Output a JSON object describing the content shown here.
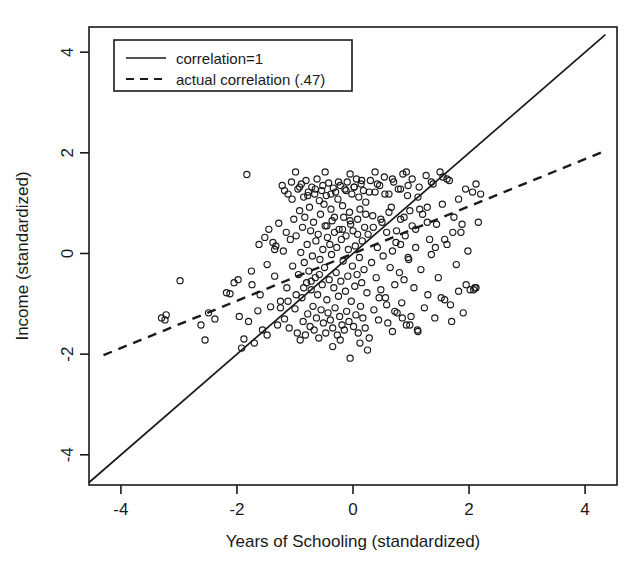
{
  "chart_data": {
    "type": "scatter",
    "title": "",
    "xlabel": "Years of Schooling (standardized)",
    "ylabel": "Income (standardized)",
    "xlim": [
      -4.55,
      4.55
    ],
    "ylim": [
      -4.6,
      4.5
    ],
    "xticks": [
      -4,
      -2,
      0,
      2,
      4
    ],
    "xtick_labels": [
      "-4",
      "-2",
      "0",
      "2",
      "4"
    ],
    "yticks": [
      -4,
      -2,
      0,
      2,
      4
    ],
    "ytick_labels": [
      "-4",
      "-2",
      "0",
      "2",
      "4"
    ],
    "grid": false,
    "legend_position": "top-left",
    "legend": [
      {
        "label": "correlation=1",
        "style": "solid"
      },
      {
        "label": "actual correlation (.47)",
        "style": "dashed"
      }
    ],
    "lines": [
      {
        "name": "correlation=1",
        "style": "solid",
        "slope": 1,
        "intercept": 0,
        "x0": -4.55,
        "y0": -4.55,
        "x1": 4.35,
        "y1": 4.35
      },
      {
        "name": "actual correlation (.47)",
        "style": "dashed",
        "slope": 0.47,
        "intercept": 0,
        "x0": -4.3,
        "y0": -2.02,
        "x1": 4.35,
        "y1": 2.04
      }
    ],
    "marker": {
      "shape": "circle-open",
      "radius_px": 3.1,
      "color": "#1a1a1a"
    },
    "n_points": 300,
    "points": [
      [
        -3.3,
        -1.28
      ],
      [
        -3.24,
        -1.32
      ],
      [
        -3.22,
        -1.22
      ],
      [
        -2.98,
        -0.54
      ],
      [
        -2.62,
        -1.42
      ],
      [
        -2.55,
        -1.72
      ],
      [
        -2.49,
        -1.18
      ],
      [
        -2.38,
        -1.3
      ],
      [
        -2.18,
        -0.78
      ],
      [
        -2.12,
        -0.8
      ],
      [
        -2.05,
        -0.58
      ],
      [
        -1.98,
        -0.52
      ],
      [
        -1.96,
        -1.25
      ],
      [
        -1.92,
        -1.88
      ],
      [
        -1.88,
        -1.7
      ],
      [
        -1.83,
        1.57
      ],
      [
        -1.8,
        -1.35
      ],
      [
        -1.74,
        -0.62
      ],
      [
        -1.7,
        -1.78
      ],
      [
        -1.64,
        -1.14
      ],
      [
        -1.6,
        -0.82
      ],
      [
        -1.56,
        -1.52
      ],
      [
        -1.52,
        0.32
      ],
      [
        -1.48,
        -1.62
      ],
      [
        -1.45,
        0.48
      ],
      [
        -1.42,
        -1.06
      ],
      [
        -1.38,
        0.22
      ],
      [
        -1.35,
        -0.45
      ],
      [
        -1.33,
        0.15
      ],
      [
        -1.3,
        -1.42
      ],
      [
        -1.28,
        0.6
      ],
      [
        -1.25,
        -0.95
      ],
      [
        -1.22,
        1.35
      ],
      [
        -1.2,
        0.05
      ],
      [
        -1.18,
        -1.3
      ],
      [
        -1.15,
        0.42
      ],
      [
        -1.14,
        -0.68
      ],
      [
        -1.12,
        1.18
      ],
      [
        -1.1,
        -1.48
      ],
      [
        -1.08,
        0.28
      ],
      [
        -1.06,
        1.42
      ],
      [
        -1.04,
        -0.25
      ],
      [
        -1.02,
        0.68
      ],
      [
        -1.0,
        -1.1
      ],
      [
        -0.99,
        1.62
      ],
      [
        -0.98,
        0.35
      ],
      [
        -0.96,
        -1.58
      ],
      [
        -0.95,
        1.28
      ],
      [
        -0.94,
        -0.42
      ],
      [
        -0.92,
        0.85
      ],
      [
        -0.91,
        -1.72
      ],
      [
        -0.9,
        0.02
      ],
      [
        -0.89,
        1.38
      ],
      [
        -0.88,
        -0.88
      ],
      [
        -0.87,
        0.52
      ],
      [
        -0.86,
        -1.35
      ],
      [
        -0.85,
        1.12
      ],
      [
        -0.84,
        -0.18
      ],
      [
        -0.83,
        0.72
      ],
      [
        -0.82,
        -1.62
      ],
      [
        -0.81,
        1.45
      ],
      [
        -0.8,
        -0.58
      ],
      [
        -0.79,
        0.18
      ],
      [
        -0.78,
        -1.2
      ],
      [
        -0.77,
        1.22
      ],
      [
        -0.76,
        -0.35
      ],
      [
        -0.75,
        0.92
      ],
      [
        -0.74,
        -1.45
      ],
      [
        -0.73,
        0.45
      ],
      [
        -0.72,
        -0.72
      ],
      [
        -0.71,
        1.32
      ],
      [
        -0.7,
        -0.05
      ],
      [
        -0.69,
        -1.05
      ],
      [
        -0.68,
        0.62
      ],
      [
        -0.67,
        -1.52
      ],
      [
        -0.66,
        1.18
      ],
      [
        -0.65,
        -0.48
      ],
      [
        -0.64,
        0.25
      ],
      [
        -0.63,
        -1.28
      ],
      [
        -0.62,
        1.48
      ],
      [
        -0.61,
        -0.82
      ],
      [
        -0.6,
        0.38
      ],
      [
        -0.59,
        -1.68
      ],
      [
        -0.58,
        1.05
      ],
      [
        -0.57,
        -0.12
      ],
      [
        -0.56,
        0.78
      ],
      [
        -0.55,
        -1.12
      ],
      [
        -0.54,
        1.25
      ],
      [
        -0.53,
        -0.62
      ],
      [
        -0.52,
        0.08
      ],
      [
        -0.51,
        -1.38
      ],
      [
        -0.5,
        0.98
      ],
      [
        -0.49,
        -0.28
      ],
      [
        -0.48,
        0.55
      ],
      [
        -0.47,
        -1.58
      ],
      [
        -0.46,
        1.15
      ],
      [
        -0.45,
        -0.92
      ],
      [
        -0.44,
        0.32
      ],
      [
        -0.43,
        -1.18
      ],
      [
        -0.42,
        1.4
      ],
      [
        -0.41,
        -0.52
      ],
      [
        -0.4,
        0.18
      ],
      [
        -0.39,
        -1.32
      ],
      [
        -0.38,
        0.88
      ],
      [
        -0.37,
        -0.02
      ],
      [
        -0.36,
        0.65
      ],
      [
        -0.35,
        -1.48
      ],
      [
        -0.34,
        1.3
      ],
      [
        -0.33,
        -0.68
      ],
      [
        -0.32,
        0.42
      ],
      [
        -0.31,
        -1.08
      ],
      [
        -0.3,
        1.22
      ],
      [
        -0.29,
        -0.38
      ],
      [
        -0.28,
        0.12
      ],
      [
        -0.27,
        -1.62
      ],
      [
        -0.26,
        1.08
      ],
      [
        -0.25,
        -0.85
      ],
      [
        -0.24,
        0.48
      ],
      [
        -0.23,
        -1.25
      ],
      [
        -0.22,
        1.35
      ],
      [
        -0.21,
        -0.55
      ],
      [
        -0.2,
        0.28
      ],
      [
        -0.19,
        -1.42
      ],
      [
        -0.18,
        0.95
      ],
      [
        -0.17,
        -0.15
      ],
      [
        -0.16,
        0.72
      ],
      [
        -0.15,
        -1.52
      ],
      [
        -0.14,
        1.28
      ],
      [
        -0.13,
        -0.75
      ],
      [
        -0.12,
        0.35
      ],
      [
        -0.11,
        -1.15
      ],
      [
        -0.1,
        1.42
      ],
      [
        -0.09,
        -0.45
      ],
      [
        -0.08,
        0.08
      ],
      [
        -0.07,
        -1.35
      ],
      [
        -0.06,
        0.82
      ],
      [
        -0.05,
        -2.08
      ],
      [
        -0.04,
        0.58
      ],
      [
        -0.03,
        -0.95
      ],
      [
        -0.02,
        1.18
      ],
      [
        -0.01,
        -0.25
      ],
      [
        0.0,
        0.45
      ],
      [
        0.01,
        -1.45
      ],
      [
        0.02,
        1.32
      ],
      [
        0.03,
        -0.65
      ],
      [
        0.04,
        0.15
      ],
      [
        0.05,
        -1.22
      ],
      [
        0.06,
        1.48
      ],
      [
        0.07,
        -0.42
      ],
      [
        0.08,
        0.68
      ],
      [
        0.09,
        -1.58
      ],
      [
        0.1,
        1.12
      ],
      [
        0.11,
        -0.08
      ],
      [
        0.12,
        0.88
      ],
      [
        0.13,
        -1.05
      ],
      [
        0.14,
        1.38
      ],
      [
        0.15,
        -0.58
      ],
      [
        0.16,
        0.25
      ],
      [
        0.17,
        -1.28
      ],
      [
        0.18,
        1.25
      ],
      [
        0.19,
        -0.32
      ],
      [
        0.2,
        0.52
      ],
      [
        0.21,
        -1.48
      ],
      [
        0.22,
        1.02
      ],
      [
        0.24,
        -0.78
      ],
      [
        0.26,
        0.38
      ],
      [
        0.28,
        -1.68
      ],
      [
        0.3,
        1.45
      ],
      [
        0.32,
        -0.18
      ],
      [
        0.34,
        0.75
      ],
      [
        0.36,
        -1.12
      ],
      [
        0.38,
        1.22
      ],
      [
        0.4,
        -0.48
      ],
      [
        0.42,
        0.12
      ],
      [
        0.44,
        -1.32
      ],
      [
        0.46,
        1.35
      ],
      [
        0.48,
        -0.72
      ],
      [
        0.5,
        0.62
      ],
      [
        0.52,
        -0.05
      ],
      [
        0.54,
        1.52
      ],
      [
        0.56,
        -0.88
      ],
      [
        0.58,
        0.42
      ],
      [
        0.6,
        -1.38
      ],
      [
        0.62,
        1.18
      ],
      [
        0.64,
        -0.28
      ],
      [
        0.66,
        0.92
      ],
      [
        0.68,
        -1.55
      ],
      [
        0.7,
        1.42
      ],
      [
        0.72,
        -0.62
      ],
      [
        0.74,
        0.22
      ],
      [
        0.76,
        -1.18
      ],
      [
        0.78,
        1.28
      ],
      [
        0.8,
        -0.38
      ],
      [
        0.82,
        0.68
      ],
      [
        0.84,
        -0.98
      ],
      [
        0.86,
        1.58
      ],
      [
        0.88,
        -0.52
      ],
      [
        0.9,
        0.35
      ],
      [
        0.92,
        -1.42
      ],
      [
        0.94,
        1.15
      ],
      [
        0.96,
        -0.12
      ],
      [
        0.98,
        0.85
      ],
      [
        1.0,
        -1.25
      ],
      [
        1.02,
        1.48
      ],
      [
        1.05,
        -0.68
      ],
      [
        1.08,
        0.48
      ],
      [
        1.11,
        -1.52
      ],
      [
        1.14,
        1.32
      ],
      [
        1.17,
        -0.32
      ],
      [
        1.2,
        0.78
      ],
      [
        1.23,
        -1.08
      ],
      [
        1.26,
        1.55
      ],
      [
        1.29,
        -0.82
      ],
      [
        1.32,
        0.28
      ],
      [
        1.35,
        -0.02
      ],
      [
        1.38,
        1.38
      ],
      [
        1.41,
        -1.28
      ],
      [
        1.44,
        0.58
      ],
      [
        1.47,
        -0.48
      ],
      [
        1.5,
        1.62
      ],
      [
        1.54,
        0.98
      ],
      [
        1.58,
        -0.92
      ],
      [
        1.62,
        0.18
      ],
      [
        1.66,
        1.45
      ],
      [
        1.7,
        -1.35
      ],
      [
        1.74,
        0.72
      ],
      [
        1.78,
        -0.22
      ],
      [
        1.82,
        1.08
      ],
      [
        1.86,
        0.42
      ],
      [
        1.9,
        -1.18
      ],
      [
        1.94,
        1.28
      ],
      [
        1.98,
        0.05
      ],
      [
        2.02,
        -0.72
      ],
      [
        2.06,
        1.22
      ],
      [
        2.1,
        -0.68
      ],
      [
        2.12,
        1.38
      ],
      [
        2.16,
        0.62
      ],
      [
        2.2,
        1.18
      ],
      [
        1.55,
        1.52
      ],
      [
        1.62,
        1.48
      ],
      [
        1.35,
        1.42
      ],
      [
        1.28,
        0.92
      ],
      [
        1.12,
        1.12
      ],
      [
        0.95,
        1.35
      ],
      [
        0.82,
        1.28
      ],
      [
        0.68,
        1.48
      ],
      [
        0.55,
        1.18
      ],
      [
        0.42,
        1.38
      ],
      [
        0.28,
        1.22
      ],
      [
        0.15,
        1.45
      ],
      [
        0.02,
        1.32
      ],
      [
        -0.12,
        1.25
      ],
      [
        -0.25,
        1.42
      ],
      [
        -0.38,
        1.18
      ],
      [
        -0.52,
        1.35
      ],
      [
        -0.65,
        1.28
      ],
      [
        -0.78,
        1.15
      ],
      [
        -0.92,
        1.32
      ],
      [
        -1.05,
        1.08
      ],
      [
        -1.18,
        1.25
      ],
      [
        -0.45,
        0.55
      ],
      [
        -0.32,
        0.72
      ],
      [
        -0.18,
        0.48
      ],
      [
        -0.05,
        0.65
      ],
      [
        0.08,
        0.38
      ],
      [
        0.22,
        0.78
      ],
      [
        0.35,
        0.52
      ],
      [
        0.48,
        0.68
      ],
      [
        0.62,
        0.82
      ],
      [
        0.75,
        0.45
      ],
      [
        0.88,
        0.72
      ],
      [
        1.02,
        0.55
      ],
      [
        1.15,
        0.88
      ],
      [
        1.28,
        0.62
      ],
      [
        -0.58,
        -0.42
      ],
      [
        -0.72,
        -0.55
      ],
      [
        -0.85,
        -0.68
      ],
      [
        -0.98,
        -0.82
      ],
      [
        -1.12,
        -0.95
      ],
      [
        -1.25,
        -1.08
      ],
      [
        0.45,
        -0.88
      ],
      [
        0.58,
        -1.02
      ],
      [
        0.72,
        -1.15
      ],
      [
        0.85,
        -1.28
      ],
      [
        0.98,
        -1.42
      ],
      [
        1.12,
        -1.55
      ],
      [
        -0.22,
        -1.72
      ],
      [
        -0.35,
        -1.85
      ],
      [
        0.12,
        -1.78
      ],
      [
        0.25,
        -1.92
      ],
      [
        1.52,
        -0.88
      ],
      [
        1.68,
        -1.02
      ],
      [
        1.82,
        -0.75
      ],
      [
        1.95,
        -0.62
      ],
      [
        2.08,
        -0.72
      ],
      [
        2.12,
        -0.68
      ],
      [
        1.42,
        0.12
      ],
      [
        1.58,
        0.28
      ],
      [
        1.72,
        0.42
      ],
      [
        1.88,
        0.58
      ],
      [
        -1.35,
        0.08
      ],
      [
        -1.48,
        -0.22
      ],
      [
        -1.62,
        0.18
      ],
      [
        -1.75,
        -0.35
      ],
      [
        0.68,
        0.05
      ],
      [
        0.82,
        0.18
      ],
      [
        0.95,
        -0.08
      ],
      [
        1.08,
        0.12
      ],
      [
        -0.48,
        1.62
      ],
      [
        -0.05,
        1.58
      ],
      [
        0.38,
        1.62
      ],
      [
        0.92,
        1.62
      ]
    ]
  }
}
